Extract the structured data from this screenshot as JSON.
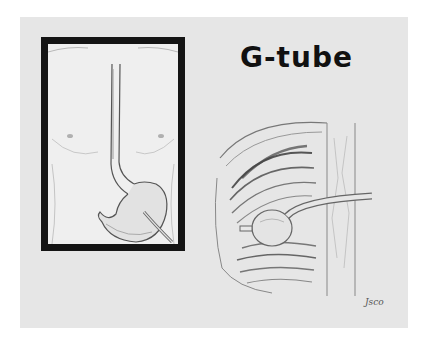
{
  "slide": {
    "title": "G-tube",
    "background_color": "#e6e6e6",
    "frame_color": "#141414"
  },
  "illustrations": {
    "left_panel": {
      "subject": "torso-with-esophagus-stomach-and-gastrostomy-tube"
    },
    "right_panel": {
      "subject": "cross-section-stomach-wall-with-balloon-g-tube"
    }
  },
  "signature": "Jsco"
}
